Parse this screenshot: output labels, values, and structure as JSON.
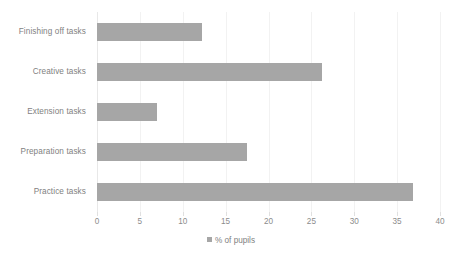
{
  "chart_data": {
    "type": "bar",
    "orientation": "horizontal",
    "title": "",
    "subtitle": "",
    "xlabel": "",
    "ylabel": "",
    "categories": [
      "Finishing off tasks",
      "Creative tasks",
      "Extension tasks",
      "Preparation tasks",
      "Practice tasks"
    ],
    "values": [
      12.2,
      26.2,
      7.0,
      17.5,
      36.8
    ],
    "series": [
      {
        "name": "% of pupils",
        "values": [
          12.2,
          26.2,
          7.0,
          17.5,
          36.8
        ],
        "color": "#A6A6A6"
      }
    ],
    "xlim": [
      0,
      40
    ],
    "xticks": [
      0,
      5,
      10,
      15,
      20,
      25,
      30,
      35,
      40
    ],
    "xtick_labels": [
      "0",
      "5",
      "10",
      "15",
      "20",
      "25",
      "30",
      "35",
      "40"
    ],
    "grid": "vertical",
    "legend": {
      "position": "bottom",
      "entries": [
        {
          "label": "% of pupils",
          "color": "#A6A6A6",
          "marker": "square"
        }
      ]
    },
    "colors": {
      "bar": "#A6A6A6",
      "gridline": "#F2F2F2",
      "text": "#7F7F7F",
      "background": "#FFFFFF"
    }
  }
}
